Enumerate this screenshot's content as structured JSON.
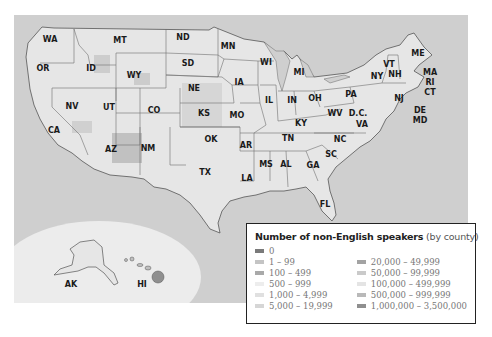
{
  "map": {
    "background_color": "#cfcfcf",
    "land_color": "#e6e6e6",
    "inset_color": "#ececec",
    "states": [
      {
        "abbr": "WA",
        "x": 36,
        "y": 27
      },
      {
        "abbr": "OR",
        "x": 29,
        "y": 56
      },
      {
        "abbr": "ID",
        "x": 77,
        "y": 56
      },
      {
        "abbr": "MT",
        "x": 106,
        "y": 28
      },
      {
        "abbr": "WY",
        "x": 120,
        "y": 63
      },
      {
        "abbr": "ND",
        "x": 169,
        "y": 25
      },
      {
        "abbr": "SD",
        "x": 174,
        "y": 51
      },
      {
        "abbr": "NE",
        "x": 180,
        "y": 76
      },
      {
        "abbr": "MN",
        "x": 214,
        "y": 34
      },
      {
        "abbr": "IA",
        "x": 225,
        "y": 70
      },
      {
        "abbr": "WI",
        "x": 252,
        "y": 50
      },
      {
        "abbr": "MI",
        "x": 285,
        "y": 60
      },
      {
        "abbr": "NV",
        "x": 58,
        "y": 94
      },
      {
        "abbr": "UT",
        "x": 95,
        "y": 95
      },
      {
        "abbr": "CO",
        "x": 140,
        "y": 98
      },
      {
        "abbr": "KS",
        "x": 190,
        "y": 101
      },
      {
        "abbr": "MO",
        "x": 223,
        "y": 103
      },
      {
        "abbr": "IL",
        "x": 255,
        "y": 88
      },
      {
        "abbr": "IN",
        "x": 278,
        "y": 88
      },
      {
        "abbr": "OH",
        "x": 301,
        "y": 86
      },
      {
        "abbr": "PA",
        "x": 337,
        "y": 82
      },
      {
        "abbr": "NY",
        "x": 363,
        "y": 64
      },
      {
        "abbr": "VT",
        "x": 375,
        "y": 52
      },
      {
        "abbr": "NH",
        "x": 381,
        "y": 62
      },
      {
        "abbr": "ME",
        "x": 404,
        "y": 41
      },
      {
        "abbr": "MA",
        "x": 416,
        "y": 60
      },
      {
        "abbr": "RI",
        "x": 416,
        "y": 70
      },
      {
        "abbr": "CT",
        "x": 416,
        "y": 80
      },
      {
        "abbr": "NJ",
        "x": 385,
        "y": 86
      },
      {
        "abbr": "DE",
        "x": 406,
        "y": 98
      },
      {
        "abbr": "MD",
        "x": 406,
        "y": 108
      },
      {
        "abbr": "D.C.",
        "x": 344,
        "y": 101
      },
      {
        "abbr": "WV",
        "x": 321,
        "y": 101
      },
      {
        "abbr": "VA",
        "x": 348,
        "y": 112
      },
      {
        "abbr": "KY",
        "x": 287,
        "y": 111
      },
      {
        "abbr": "CA",
        "x": 40,
        "y": 118
      },
      {
        "abbr": "AZ",
        "x": 97,
        "y": 137
      },
      {
        "abbr": "NM",
        "x": 134,
        "y": 136
      },
      {
        "abbr": "OK",
        "x": 197,
        "y": 127
      },
      {
        "abbr": "AR",
        "x": 232,
        "y": 133
      },
      {
        "abbr": "TN",
        "x": 274,
        "y": 126
      },
      {
        "abbr": "NC",
        "x": 326,
        "y": 127
      },
      {
        "abbr": "SC",
        "x": 317,
        "y": 142
      },
      {
        "abbr": "MS",
        "x": 252,
        "y": 152
      },
      {
        "abbr": "AL",
        "x": 272,
        "y": 152
      },
      {
        "abbr": "GA",
        "x": 299,
        "y": 153
      },
      {
        "abbr": "TX",
        "x": 191,
        "y": 160
      },
      {
        "abbr": "LA",
        "x": 233,
        "y": 166
      },
      {
        "abbr": "FL",
        "x": 311,
        "y": 192
      },
      {
        "abbr": "AK",
        "x": 57,
        "y": 272
      },
      {
        "abbr": "HI",
        "x": 128,
        "y": 272
      }
    ]
  },
  "legend": {
    "title": "Number of non-English speakers",
    "subtitle": "(by county)",
    "items_left": [
      {
        "label": "0",
        "color": "#7a7a7a"
      },
      {
        "label": "1 – 99",
        "color": "#c4c4c4"
      },
      {
        "label": "100 – 499",
        "color": "#a9a9a9"
      },
      {
        "label": "500 – 999",
        "color": "#ededed"
      },
      {
        "label": "1,000 – 4,999",
        "color": "#e0e0e0"
      },
      {
        "label": "5,000 – 19,999",
        "color": "#d6d6d6"
      }
    ],
    "items_right": [
      {
        "label": "20,000 – 49,999",
        "color": "#a3a3a3"
      },
      {
        "label": "50,000 – 99,999",
        "color": "#cacaca"
      },
      {
        "label": "100,000 – 499,999",
        "color": "#e4e4e4"
      },
      {
        "label": "500,000 – 999,999",
        "color": "#b9b9b9"
      },
      {
        "label": "1,000,000 – 3,500,000",
        "color": "#8f8f8f"
      }
    ]
  }
}
